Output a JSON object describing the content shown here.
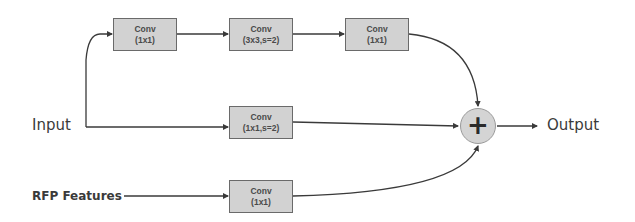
{
  "diagram": {
    "inputs": {
      "input_label": "Input",
      "rfp_label": "RFP Features"
    },
    "output_label": "Output",
    "nodes": [
      {
        "id": "conv1",
        "title": "Conv",
        "param": "(1x1)"
      },
      {
        "id": "conv2",
        "title": "Conv",
        "param": "(3x3,s=2)"
      },
      {
        "id": "conv3",
        "title": "Conv",
        "param": "(1x1)"
      },
      {
        "id": "shortcut",
        "title": "Conv",
        "param": "(1x1,s=2)"
      },
      {
        "id": "rfp_conv",
        "title": "Conv",
        "param": "(1x1)"
      }
    ],
    "sum_node": {
      "symbol": "+",
      "meaning": "element-wise addition"
    },
    "edges": [
      [
        "Input",
        "conv1"
      ],
      [
        "conv1",
        "conv2"
      ],
      [
        "conv2",
        "conv3"
      ],
      [
        "conv3",
        "sum"
      ],
      [
        "Input",
        "shortcut"
      ],
      [
        "shortcut",
        "sum"
      ],
      [
        "RFP Features",
        "rfp_conv"
      ],
      [
        "rfp_conv",
        "sum"
      ],
      [
        "sum",
        "Output"
      ]
    ],
    "colors": {
      "box_fill": "#d2d2d2",
      "box_border": "#6a6a6a",
      "line": "#3a3a3a",
      "text": "#3a3a3a"
    }
  }
}
